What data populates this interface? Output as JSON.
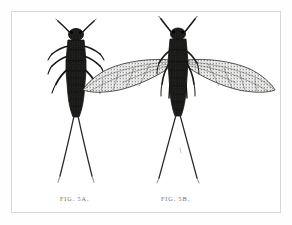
{
  "plate": {
    "type": "scientific-illustration",
    "medium": "engraving / stipple line drawing",
    "background_color": "#ffffff",
    "ink_color": "#1a1a1a",
    "border_color": "#d8d8d6",
    "caption_color": "#6e6b66",
    "width": 292,
    "height": 225
  },
  "figures": [
    {
      "id": "fig-5a",
      "caption": "Fig. 5a.",
      "subject": "stonefly nymph (wingless larval form), dorsal view",
      "has_wings": false,
      "antennae_count": 2,
      "leg_pairs": 3,
      "cerci_count": 2,
      "center_x": 76,
      "top_y": 25,
      "body_length": 90,
      "cerci_length": 75
    },
    {
      "id": "fig-5b",
      "caption": "Fig. 5b.",
      "subject": "stonefly adult (winged imago), dorsal view with wings spread",
      "has_wings": true,
      "wing_pairs": 2,
      "antennae_count": 2,
      "leg_pairs": 3,
      "cerci_count": 2,
      "center_x": 178,
      "top_y": 25,
      "body_length": 88,
      "cerci_length": 78,
      "wingspan": 160
    }
  ],
  "captions": {
    "fig_a_label": "FIG. 5A.",
    "fig_b_label": "FIG. 5B."
  }
}
